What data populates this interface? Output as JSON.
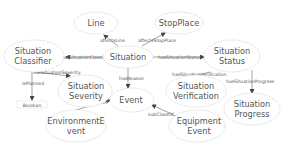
{
  "diagram": {
    "type": "ontology-graph",
    "nodes": {
      "line": {
        "label": [
          "Line"
        ]
      },
      "stopplace": {
        "label": [
          "StopPlace"
        ]
      },
      "classifier": {
        "label": [
          "Situation",
          "Classifier"
        ]
      },
      "situation": {
        "label": [
          "Situation"
        ]
      },
      "status": {
        "label": [
          "Situation",
          "Status"
        ]
      },
      "severity": {
        "label": [
          "Situation",
          "Severity"
        ]
      },
      "event": {
        "label": [
          "Event"
        ]
      },
      "verification": {
        "label": [
          "Situation",
          "Verification"
        ]
      },
      "progress": {
        "label": [
          "Situation",
          "Progress"
        ]
      },
      "envevent": {
        "label": [
          "EnvironmentE",
          "vent"
        ]
      },
      "equipevent": {
        "label": [
          "Equipment",
          "Event"
        ]
      },
      "boolean": {
        "label": [
          "Boolean"
        ]
      }
    },
    "edges": {
      "affectsLine": "affectsLine",
      "affectsStopPlace": "affectsStopPlace",
      "hasSituationClassifier": "hasSituationClassifier",
      "hasSituationStatus": "hasSituationStatus",
      "hasReason": "hasReason",
      "hasSituationSeverity": "hasSituationSeverity",
      "isPlanned": "isPlanned",
      "hasSituationVerification": "hasSituationVerification",
      "hasSituationProgress": "hasSituationProgress",
      "subClassOfEnv": "subClassOf",
      "subClassOfEquip": "subClassOf"
    },
    "colors": {
      "node_border": "#d6d6d6",
      "edge": "#666666",
      "text": "#555555"
    }
  }
}
